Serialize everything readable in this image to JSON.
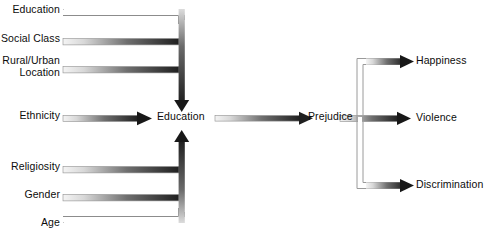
{
  "diagram": {
    "background_color": "#ffffff",
    "text_color": "#0c0c0c",
    "arrow_dark_color": "#262626",
    "arrow_light_color": "#f2f2f2",
    "arrow_outline_color": "#8c8c8c"
  },
  "predictors": [
    {
      "id": "education-origin",
      "label": "Education",
      "style": "hollow",
      "route": "elbow-down"
    },
    {
      "id": "social-class",
      "label": "Social Class",
      "style": "gradient",
      "route": "elbow-down"
    },
    {
      "id": "rural-urban",
      "label": "Rural/Urban\nLocation",
      "style": "gradient",
      "route": "elbow-down"
    },
    {
      "id": "ethnicity",
      "label": "Ethnicity",
      "style": "gradient",
      "route": "direct"
    },
    {
      "id": "religiosity",
      "label": "Religiosity",
      "style": "gradient",
      "route": "elbow-up"
    },
    {
      "id": "gender",
      "label": "Gender",
      "style": "gradient",
      "route": "elbow-up"
    },
    {
      "id": "age",
      "label": "Age",
      "style": "hollow",
      "route": "elbow-up"
    }
  ],
  "mediators": [
    {
      "id": "education-node",
      "label": "Education"
    },
    {
      "id": "prejudice-node",
      "label": "Prejudice"
    }
  ],
  "outcomes": [
    {
      "id": "happiness",
      "label": "Happiness",
      "style": "gradient",
      "route": "elbow-up"
    },
    {
      "id": "violence",
      "label": "Violence",
      "style": "gradient",
      "route": "direct"
    },
    {
      "id": "discrimination",
      "label": "Discrimination",
      "style": "gradient",
      "route": "elbow-down"
    }
  ],
  "links": [
    {
      "from": "education-origin",
      "to": "education-node"
    },
    {
      "from": "social-class",
      "to": "education-node"
    },
    {
      "from": "rural-urban",
      "to": "education-node"
    },
    {
      "from": "ethnicity",
      "to": "education-node"
    },
    {
      "from": "religiosity",
      "to": "education-node"
    },
    {
      "from": "gender",
      "to": "education-node"
    },
    {
      "from": "age",
      "to": "education-node"
    },
    {
      "from": "education-node",
      "to": "prejudice-node"
    },
    {
      "from": "prejudice-node",
      "to": "happiness"
    },
    {
      "from": "prejudice-node",
      "to": "violence"
    },
    {
      "from": "prejudice-node",
      "to": "discrimination"
    }
  ]
}
